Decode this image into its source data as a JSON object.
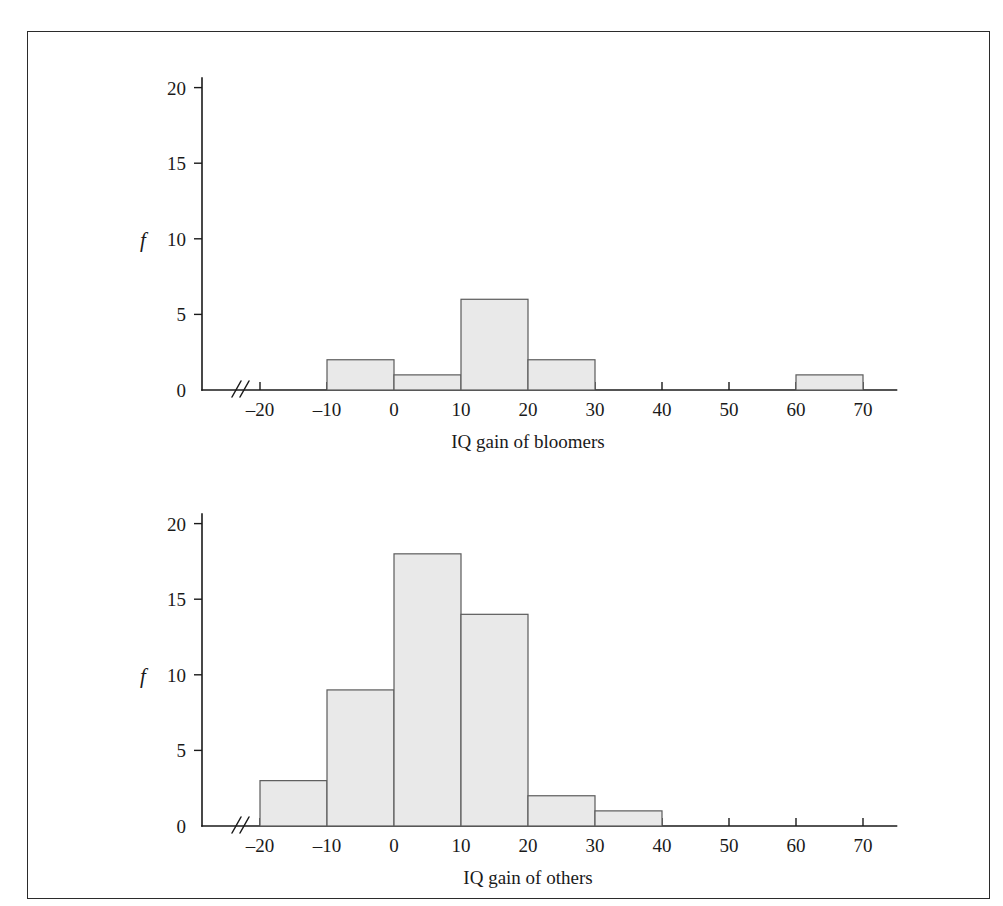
{
  "page": {
    "background_color": "#ffffff",
    "border_color": "#2b2b2b",
    "bar_fill_color": "#e9e9e9",
    "bar_stroke_color": "#5b5b5b",
    "axis_color": "#1a1a1a"
  },
  "chart_data": [
    {
      "type": "bar",
      "id": "bloomers-histogram",
      "title": "",
      "xlabel": "IQ gain of bloomers",
      "ylabel": "f",
      "xlim": [
        -25,
        75
      ],
      "ylim": [
        0,
        21
      ],
      "xticks": [
        -20,
        -10,
        0,
        10,
        20,
        30,
        40,
        50,
        60,
        70
      ],
      "xtick_labels": [
        "–20",
        "–10",
        "0",
        "10",
        "20",
        "30",
        "40",
        "50",
        "60",
        "70"
      ],
      "yticks": [
        0,
        5,
        10,
        15,
        20
      ],
      "ytick_labels": [
        "0",
        "5",
        "10",
        "15",
        "20"
      ],
      "grid": false,
      "legend": "none",
      "axis_break": true,
      "bin_width": 10,
      "bins": [
        {
          "start": -20,
          "end": -10,
          "value": 0
        },
        {
          "start": -10,
          "end": 0,
          "value": 2
        },
        {
          "start": 0,
          "end": 10,
          "value": 1
        },
        {
          "start": 10,
          "end": 20,
          "value": 6
        },
        {
          "start": 20,
          "end": 30,
          "value": 2
        },
        {
          "start": 30,
          "end": 40,
          "value": 0
        },
        {
          "start": 40,
          "end": 50,
          "value": 0
        },
        {
          "start": 50,
          "end": 60,
          "value": 0
        },
        {
          "start": 60,
          "end": 70,
          "value": 1
        }
      ]
    },
    {
      "type": "bar",
      "id": "others-histogram",
      "title": "",
      "xlabel": "IQ gain of others",
      "ylabel": "f",
      "xlim": [
        -25,
        75
      ],
      "ylim": [
        0,
        21
      ],
      "xticks": [
        -20,
        -10,
        0,
        10,
        20,
        30,
        40,
        50,
        60,
        70
      ],
      "xtick_labels": [
        "–20",
        "–10",
        "0",
        "10",
        "20",
        "30",
        "40",
        "50",
        "60",
        "70"
      ],
      "yticks": [
        0,
        5,
        10,
        15,
        20
      ],
      "ytick_labels": [
        "0",
        "5",
        "10",
        "15",
        "20"
      ],
      "grid": false,
      "legend": "none",
      "axis_break": true,
      "bin_width": 10,
      "bins": [
        {
          "start": -20,
          "end": -10,
          "value": 3
        },
        {
          "start": -10,
          "end": 0,
          "value": 9
        },
        {
          "start": 0,
          "end": 10,
          "value": 18
        },
        {
          "start": 10,
          "end": 20,
          "value": 14
        },
        {
          "start": 20,
          "end": 30,
          "value": 2
        },
        {
          "start": 30,
          "end": 40,
          "value": 1
        },
        {
          "start": 40,
          "end": 50,
          "value": 0
        },
        {
          "start": 50,
          "end": 60,
          "value": 0
        },
        {
          "start": 60,
          "end": 70,
          "value": 0
        }
      ]
    }
  ]
}
